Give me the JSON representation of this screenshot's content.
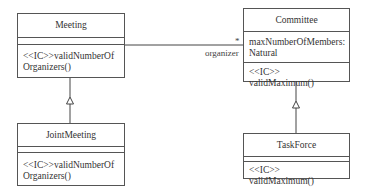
{
  "classes": {
    "meeting": {
      "name": "Meeting",
      "attributes": "",
      "operations": [
        "<<IC>>validNumberOf",
        "Organizers()"
      ]
    },
    "committee": {
      "name": "Committee",
      "attributes": [
        "maxNumberOfMembers:",
        "Natural"
      ],
      "operations": [
        "<<IC>> validMaximum()"
      ]
    },
    "joint_meeting": {
      "name": "JointMeeting",
      "attributes": "",
      "operations": [
        "<<IC>>validNumberOf",
        "Organizers()"
      ]
    },
    "task_force": {
      "name": "TaskForce",
      "attributes": "",
      "operations": [
        "<<IC>> validMaximum()"
      ]
    }
  },
  "association": {
    "multiplicity": "*",
    "role": "organizer"
  },
  "generalizations": [
    {
      "child": "JointMeeting",
      "parent": "Meeting"
    },
    {
      "child": "TaskForce",
      "parent": "Committee"
    }
  ]
}
